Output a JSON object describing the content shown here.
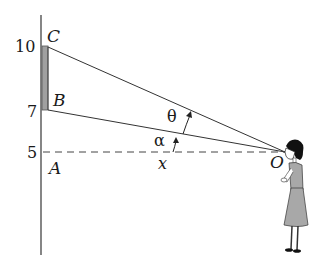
{
  "diagram": {
    "axis_labels": {
      "y10": "10",
      "y7": "7",
      "y5": "5"
    },
    "points": {
      "C": "C",
      "B": "B",
      "A": "A",
      "O": "O"
    },
    "angles": {
      "theta": "θ",
      "alpha": "α"
    },
    "distance_label": "x",
    "colors": {
      "line": "#333333",
      "screen_fill": "#9a9a9a",
      "dress_fill": "#a8a8a8",
      "hair": "#111111"
    }
  }
}
